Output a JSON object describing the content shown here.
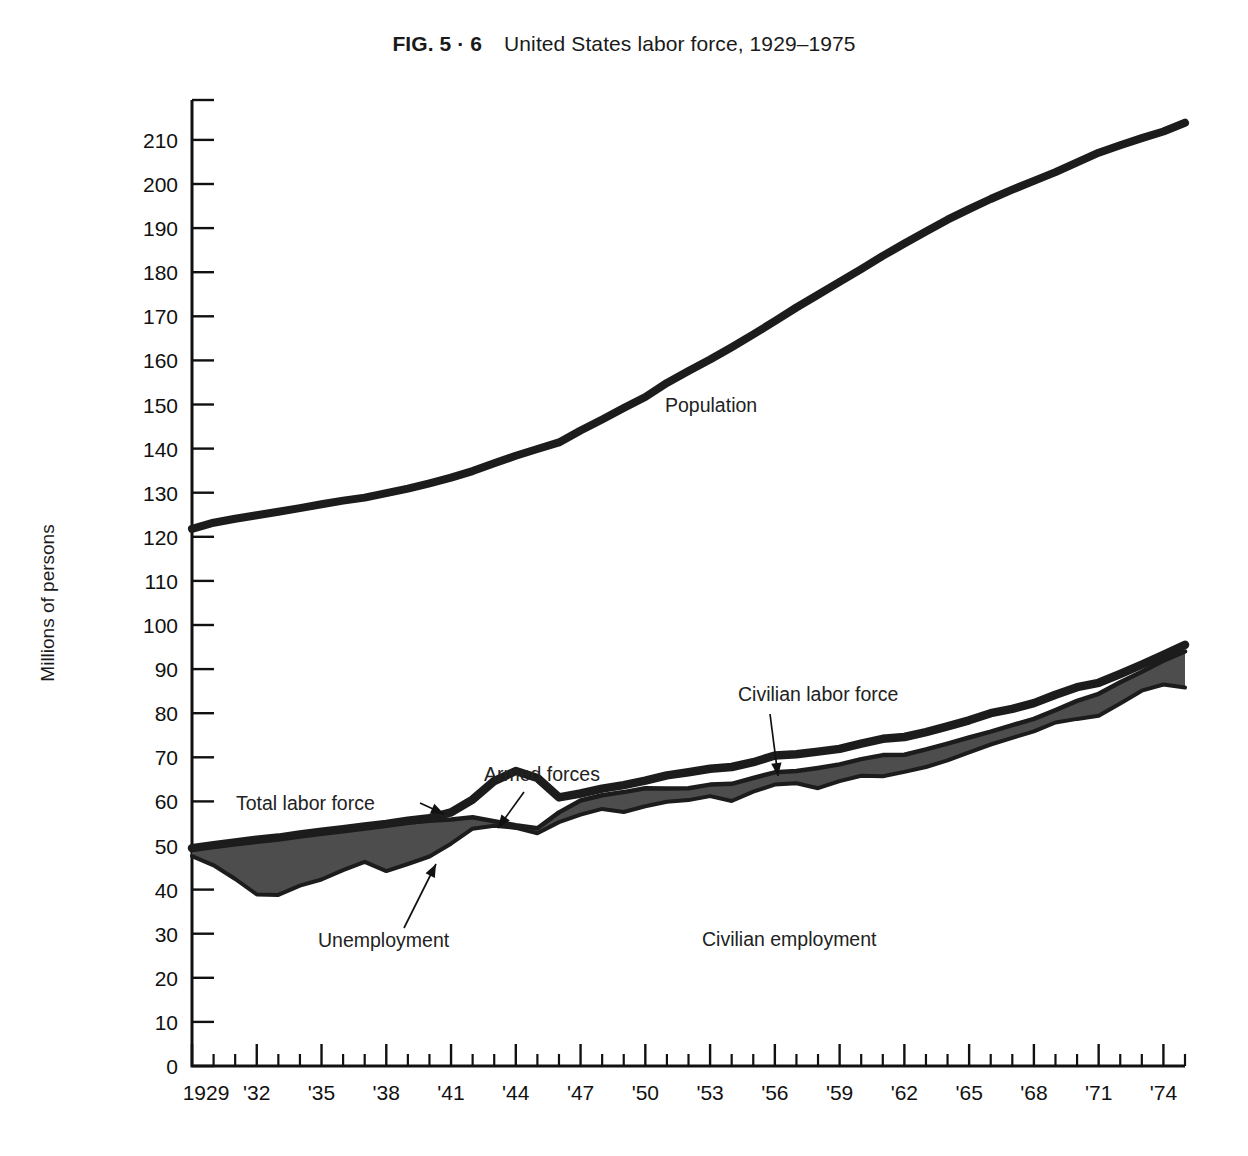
{
  "figure": {
    "fig_number": "FIG. 5 · 6",
    "caption": "United States labor force, 1929–1975",
    "ylabel": "Millions of persons"
  },
  "annotations": {
    "population": "Population",
    "civilian_labor_force": "Civilian labor force",
    "armed_forces": "Armed forces",
    "total_labor_force": "Total labor force",
    "unemployment": "Unemployment",
    "civilian_employment": "Civilian employment"
  },
  "colors": {
    "line": "#1c1c1c",
    "band_fill": "#4d4d4d",
    "axis": "#111111",
    "background": "#ffffff"
  },
  "chart_data": {
    "type": "area",
    "title": "United States labor force, 1929–1975",
    "xlabel": "",
    "ylabel": "Millions of persons",
    "xlim": [
      1929,
      1975
    ],
    "ylim": [
      0,
      215
    ],
    "yticks": [
      0,
      10,
      20,
      30,
      40,
      50,
      60,
      70,
      80,
      90,
      100,
      110,
      120,
      130,
      140,
      150,
      160,
      170,
      180,
      190,
      200,
      210
    ],
    "ytick_labels": [
      "0",
      "10",
      "20",
      "30",
      "40",
      "50",
      "60",
      "70",
      "80",
      "90",
      "100",
      "110",
      "120",
      "130",
      "140",
      "150",
      "160",
      "170",
      "180",
      "190",
      "200",
      "210"
    ],
    "xticks_minor_every": 1,
    "xtick_labels": [
      "1929",
      "'32",
      "'35",
      "'38",
      "'41",
      "'44",
      "'47",
      "'50",
      "'53",
      "'56",
      "'59",
      "'62",
      "'65",
      "'68",
      "'71",
      "'74"
    ],
    "xtick_label_years": [
      1929,
      1932,
      1935,
      1938,
      1941,
      1944,
      1947,
      1950,
      1953,
      1956,
      1959,
      1962,
      1965,
      1968,
      1971,
      1974
    ],
    "grid": false,
    "legend": "inline-annotations",
    "x": [
      1929,
      1930,
      1931,
      1932,
      1933,
      1934,
      1935,
      1936,
      1937,
      1938,
      1939,
      1940,
      1941,
      1942,
      1943,
      1944,
      1945,
      1946,
      1947,
      1948,
      1949,
      1950,
      1951,
      1952,
      1953,
      1954,
      1955,
      1956,
      1957,
      1958,
      1959,
      1960,
      1961,
      1962,
      1963,
      1964,
      1965,
      1966,
      1967,
      1968,
      1969,
      1970,
      1971,
      1972,
      1973,
      1974,
      1975
    ],
    "series": [
      {
        "name": "Population",
        "values": [
          121.8,
          123.2,
          124.1,
          124.9,
          125.7,
          126.5,
          127.4,
          128.2,
          128.9,
          129.9,
          130.9,
          132.1,
          133.4,
          134.9,
          136.7,
          138.4,
          139.9,
          141.4,
          144.1,
          146.6,
          149.2,
          151.7,
          154.9,
          157.6,
          160.2,
          163.0,
          165.9,
          168.9,
          172.0,
          174.9,
          177.8,
          180.7,
          183.7,
          186.5,
          189.2,
          191.9,
          194.3,
          196.6,
          198.7,
          200.7,
          202.7,
          204.9,
          207.1,
          208.8,
          210.4,
          211.9,
          213.9
        ]
      },
      {
        "name": "Total labor force",
        "values": [
          49.4,
          50.1,
          50.7,
          51.3,
          51.8,
          52.5,
          53.1,
          53.7,
          54.3,
          54.9,
          55.6,
          56.2,
          57.5,
          60.4,
          64.6,
          66.9,
          65.3,
          60.9,
          61.8,
          62.9,
          63.7,
          64.7,
          65.9,
          66.6,
          67.4,
          67.8,
          68.9,
          70.4,
          70.7,
          71.3,
          71.9,
          73.1,
          74.2,
          74.6,
          75.7,
          77.0,
          78.4,
          80.0,
          81.0,
          82.3,
          84.2,
          85.9,
          86.9,
          88.9,
          91.0,
          93.2,
          95.5
        ]
      },
      {
        "name": "Civilian labor force",
        "values": [
          49.2,
          49.8,
          50.4,
          51.0,
          51.6,
          52.2,
          52.9,
          53.4,
          54.0,
          54.6,
          55.2,
          55.6,
          55.9,
          56.4,
          55.5,
          54.6,
          53.9,
          57.5,
          60.2,
          61.4,
          62.1,
          63.0,
          62.9,
          63.0,
          63.8,
          64.0,
          65.3,
          66.6,
          66.9,
          67.6,
          68.4,
          69.6,
          70.5,
          70.6,
          71.8,
          73.1,
          74.5,
          75.8,
          77.3,
          78.7,
          80.7,
          82.8,
          84.4,
          87.0,
          89.4,
          91.9,
          94.0
        ]
      },
      {
        "name": "Civilian employment",
        "values": [
          47.6,
          45.5,
          42.4,
          38.9,
          38.8,
          40.9,
          42.3,
          44.4,
          46.3,
          44.2,
          45.8,
          47.5,
          50.4,
          53.8,
          54.5,
          54.0,
          52.8,
          55.3,
          57.0,
          58.3,
          57.6,
          58.9,
          59.9,
          60.3,
          61.2,
          60.1,
          62.2,
          63.8,
          64.1,
          63.0,
          64.6,
          65.8,
          65.7,
          66.7,
          67.8,
          69.3,
          71.1,
          72.9,
          74.4,
          75.9,
          77.9,
          78.7,
          79.4,
          82.2,
          85.1,
          86.5,
          85.8
        ]
      }
    ],
    "derived_bands": [
      {
        "name": "Unemployment",
        "between": [
          "Civilian employment",
          "Civilian labor force"
        ],
        "fill": "#4d4d4d"
      },
      {
        "name": "Armed forces",
        "between": [
          "Civilian labor force",
          "Total labor force"
        ],
        "fill": "#ffffff"
      }
    ],
    "notes": [
      "Shaded dark band between civilian employment and civilian labor force = unemployment",
      "White gap between civilian labor force and total labor force = armed forces"
    ]
  }
}
